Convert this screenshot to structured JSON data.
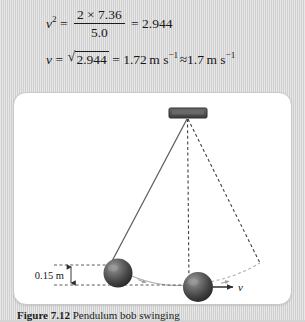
{
  "equations": {
    "line1": {
      "lhs_var": "v",
      "lhs_exp": "2",
      "eq_sign": "=",
      "numerator": "2 × 7.36",
      "denominator": "5.0",
      "eq_sign2": "=",
      "result": "2.944"
    },
    "line2": {
      "lhs_var": "v",
      "eq_sign": "=",
      "radical_sign": "√",
      "radicand": "2.944",
      "eq_sign2": "=",
      "value": "1.72",
      "unit": "m s",
      "unit_exp": "−1",
      "approx_sign": "≈",
      "value_rounded": "1.7",
      "unit2": "m s",
      "unit2_exp": "−1"
    }
  },
  "figure": {
    "caption_label": "Figure 7.12",
    "caption_text": "  Pendulum bob swinging",
    "diagram": {
      "height_label": "0.15 m",
      "velocity_label": "v",
      "pivot_name": "support-block",
      "bob_left_name": "pendulum-bob-raised",
      "bob_bottom_name": "pendulum-bob-lowest",
      "string_solid_name": "string-raised-position",
      "string_vertical_name": "string-vertical-dashed",
      "string_right_name": "string-far-position-dashed",
      "arc_name": "swing-arc"
    }
  },
  "colors": {
    "page_background": "#d6d6d6",
    "card_background": "#ffffff",
    "card_border": "#c8c8c8",
    "ink": "#1b1b1b",
    "bob_dark": "#3a3a3a",
    "bob_light": "#8d8d8d",
    "pivot_dark": "#4b4b4b",
    "line_gray": "#6e6e6e",
    "arc_gray": "#a9a9a9"
  }
}
